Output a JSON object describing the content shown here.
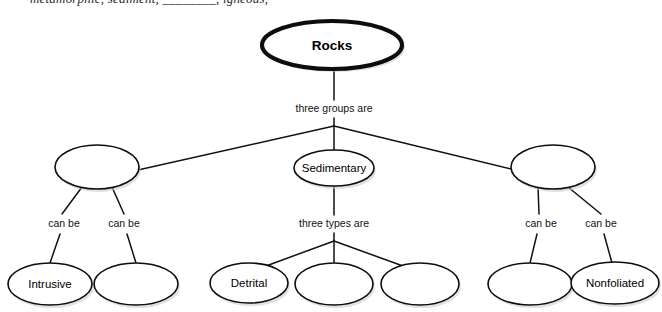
{
  "page": {
    "partial_top_line": "metamorphic, sediment, ________, igneous,"
  },
  "diagram": {
    "type": "concept-map",
    "title_node": "Rocks",
    "nodes": {
      "root": {
        "id": "rocks",
        "label": "Rocks",
        "cx": 332,
        "cy": 45,
        "rx": 70,
        "ry": 24,
        "bold": true
      },
      "mid": [
        {
          "id": "igneous-blank",
          "label": "",
          "cx": 97,
          "cy": 167,
          "rx": 42,
          "ry": 22
        },
        {
          "id": "sedimentary",
          "label": "Sedimentary",
          "cx": 334,
          "cy": 168,
          "rx": 40,
          "ry": 18
        },
        {
          "id": "metamorphic-blank",
          "label": "",
          "cx": 553,
          "cy": 167,
          "rx": 42,
          "ry": 22
        }
      ],
      "leaves": [
        {
          "id": "intrusive",
          "label": "Intrusive",
          "cx": 50,
          "cy": 284,
          "rx": 42,
          "ry": 21
        },
        {
          "id": "extrusive-blank",
          "label": "",
          "cx": 136,
          "cy": 284,
          "rx": 42,
          "ry": 21
        },
        {
          "id": "detrital",
          "label": "Detrital",
          "cx": 249,
          "cy": 283,
          "rx": 39,
          "ry": 20
        },
        {
          "id": "chemical-blank",
          "label": "",
          "cx": 334,
          "cy": 284,
          "rx": 39,
          "ry": 21
        },
        {
          "id": "organic-blank",
          "label": "",
          "cx": 420,
          "cy": 284,
          "rx": 39,
          "ry": 21
        },
        {
          "id": "foliated-blank",
          "label": "",
          "cx": 530,
          "cy": 284,
          "rx": 42,
          "ry": 21
        },
        {
          "id": "nonfoliated",
          "label": "Nonfoliated",
          "cx": 615,
          "cy": 283,
          "rx": 44,
          "ry": 21
        }
      ]
    },
    "edge_labels": [
      {
        "id": "root-relation",
        "text": "three groups are",
        "x": 334,
        "y": 109
      },
      {
        "id": "igneous-can-be-left",
        "text": "can be",
        "x": 64,
        "y": 224
      },
      {
        "id": "igneous-can-be-right",
        "text": "can be",
        "x": 124,
        "y": 224
      },
      {
        "id": "sedimentary-relation",
        "text": "three types are",
        "x": 334,
        "y": 224
      },
      {
        "id": "metamorphic-can-be-left",
        "text": "can be",
        "x": 541,
        "y": 224
      },
      {
        "id": "metamorphic-can-be-right",
        "text": "can be",
        "x": 601,
        "y": 224
      }
    ],
    "colors": {
      "stroke": "#0d0d0d",
      "fill": "#ffffff",
      "text": "#000000",
      "background": "#ffffff"
    }
  }
}
